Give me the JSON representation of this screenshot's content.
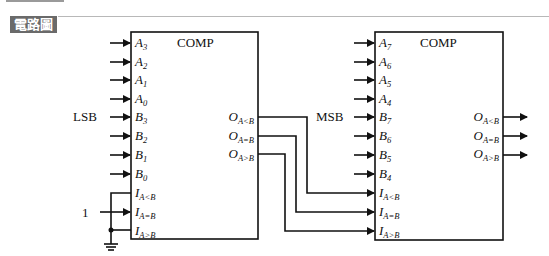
{
  "header": {
    "badge_label": "電路圖"
  },
  "diagram": {
    "left_block": {
      "title": "COMP",
      "side_label": "LSB",
      "inputs": [
        {
          "base": "A",
          "sub": "3"
        },
        {
          "base": "A",
          "sub": "2"
        },
        {
          "base": "A",
          "sub": "1"
        },
        {
          "base": "A",
          "sub": "0"
        },
        {
          "base": "B",
          "sub": "3"
        },
        {
          "base": "B",
          "sub": "2"
        },
        {
          "base": "B",
          "sub": "1"
        },
        {
          "base": "B",
          "sub": "0"
        },
        {
          "base": "I",
          "sub": "A<B"
        },
        {
          "base": "I",
          "sub": "A=B"
        },
        {
          "base": "I",
          "sub": "A>B"
        }
      ],
      "outputs": [
        {
          "base": "O",
          "sub": "A<B"
        },
        {
          "base": "O",
          "sub": "A=B"
        },
        {
          "base": "O",
          "sub": "A>B"
        }
      ],
      "const_input_label": "1"
    },
    "right_block": {
      "title": "COMP",
      "side_label": "MSB",
      "inputs": [
        {
          "base": "A",
          "sub": "7"
        },
        {
          "base": "A",
          "sub": "6"
        },
        {
          "base": "A",
          "sub": "5"
        },
        {
          "base": "A",
          "sub": "4"
        },
        {
          "base": "B",
          "sub": "7"
        },
        {
          "base": "B",
          "sub": "6"
        },
        {
          "base": "B",
          "sub": "5"
        },
        {
          "base": "B",
          "sub": "4"
        },
        {
          "base": "I",
          "sub": "A<B"
        },
        {
          "base": "I",
          "sub": "A=B"
        },
        {
          "base": "I",
          "sub": "A>B"
        }
      ],
      "outputs": [
        {
          "base": "O",
          "sub": "A<B"
        },
        {
          "base": "O",
          "sub": "A=B"
        },
        {
          "base": "O",
          "sub": "A>B"
        }
      ]
    }
  }
}
